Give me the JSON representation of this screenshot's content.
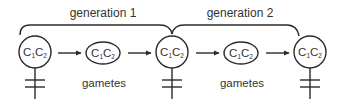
{
  "diagram": {
    "type": "inheritance-flow",
    "colors": {
      "line": "#2a2a2a",
      "text": "#333333",
      "background": "#ffffff"
    },
    "generations": [
      {
        "label": "generation 1"
      },
      {
        "label": "generation 2"
      }
    ],
    "gametes_label": "gametes",
    "nodes": [
      {
        "kind": "female-parent",
        "genotype_main": "C",
        "sub1": "1",
        "sub2": "2",
        "symbol": "female-symbol"
      },
      {
        "kind": "gamete",
        "genotype_main": "C",
        "sub1": "1",
        "sub2": "2"
      },
      {
        "kind": "female-parent",
        "genotype_main": "C",
        "sub1": "1",
        "sub2": "2",
        "symbol": "female-symbol"
      },
      {
        "kind": "gamete",
        "genotype_main": "C",
        "sub1": "1",
        "sub2": "2"
      },
      {
        "kind": "female-parent",
        "genotype_main": "C",
        "sub1": "1",
        "sub2": "2",
        "symbol": "female-symbol"
      }
    ],
    "arrows": [
      {
        "from": 0,
        "to": 1
      },
      {
        "from": 1,
        "to": 2
      },
      {
        "from": 2,
        "to": 3
      },
      {
        "from": 3,
        "to": 4
      }
    ]
  }
}
